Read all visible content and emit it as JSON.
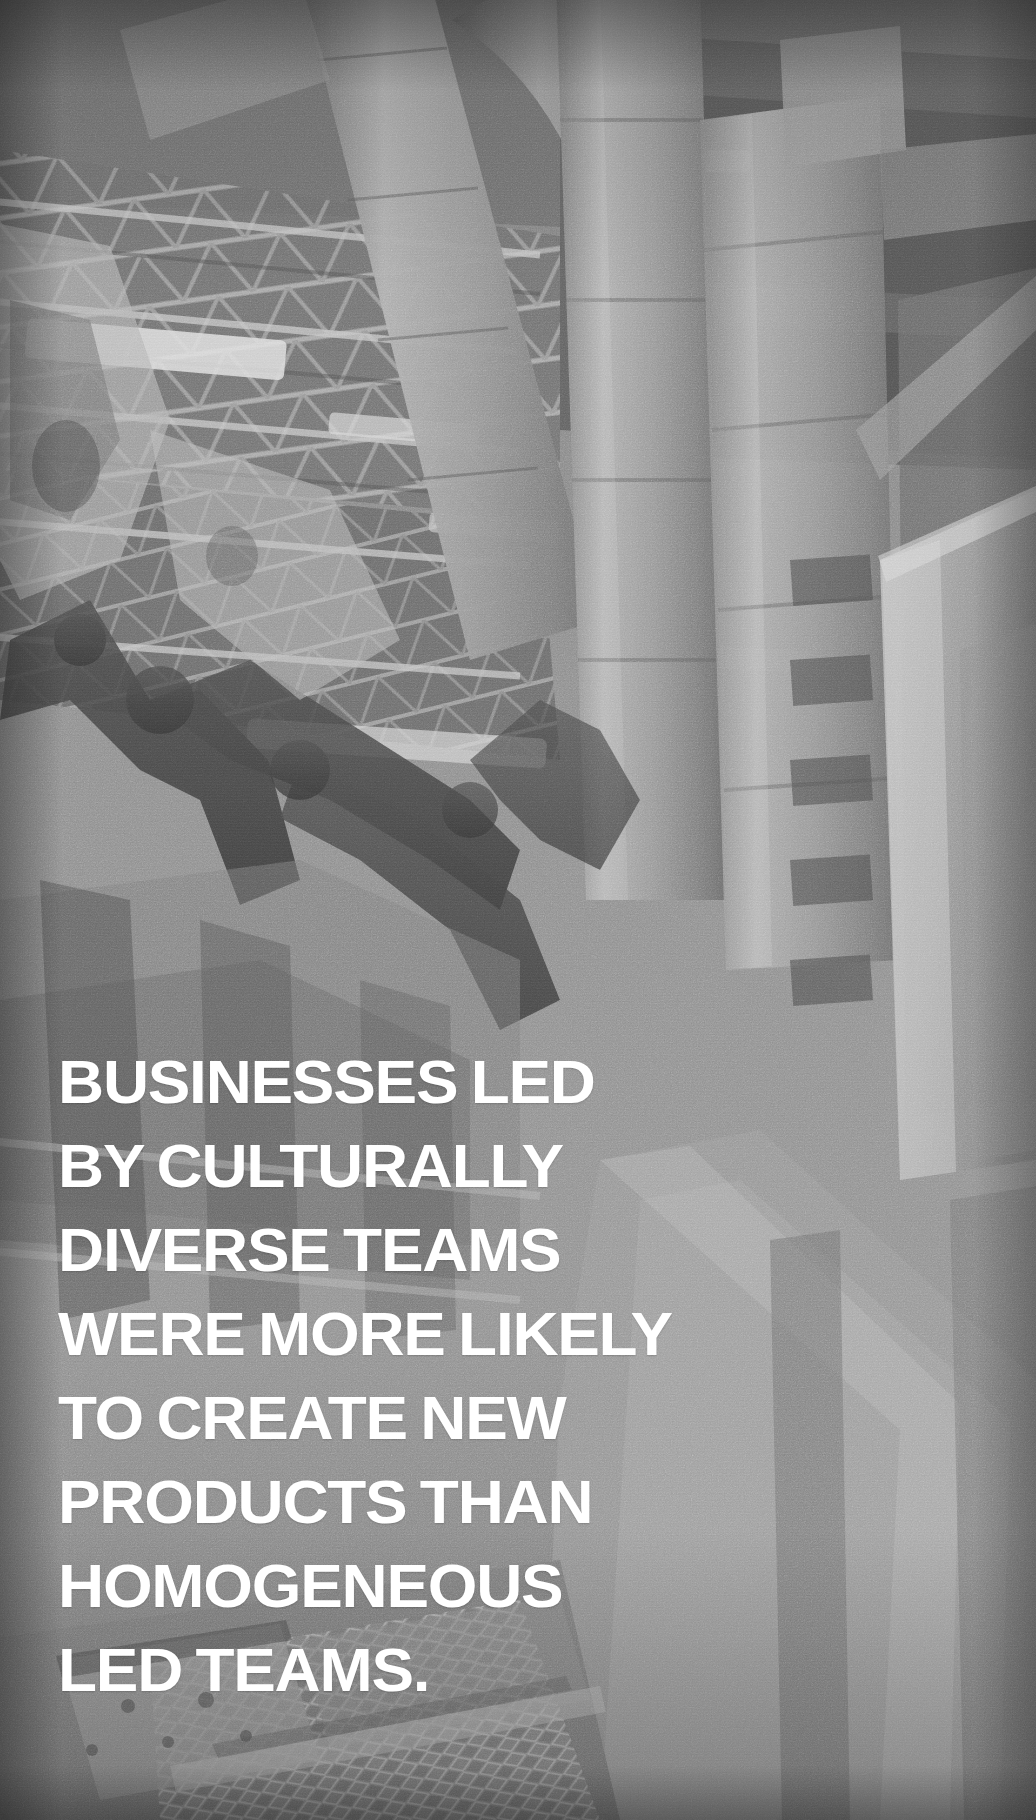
{
  "poster": {
    "width": 1036,
    "height": 1820,
    "media_type": "photographic-quote-card",
    "background_subject": "industrial factory interior with robotic assembly arms, overhead ductwork, steel roof trusses and metal grating floor",
    "background_treatment": "black-and-white, high-grain / film-noise, slight vignette"
  },
  "quote": {
    "lines": [
      "BUSINESSES LED",
      "BY CULTURALLY",
      "DIVERSE TEAMS",
      "WERE MORE LIKELY",
      "TO CREATE NEW",
      "PRODUCTS THAN",
      "HOMOGENEOUS",
      "LED TEAMS."
    ],
    "full_text": "BUSINESSES LED BY CULTURALLY DIVERSE TEAMS WERE MORE LIKELY TO CREATE NEW PRODUCTS THAN HOMOGENEOUS LED TEAMS.",
    "alignment": "left",
    "case": "uppercase"
  },
  "colors": {
    "text": "#ffffff",
    "background_midtone": "#8d8d8d",
    "background_shadow": "#3c3c3c",
    "background_highlight": "#d2d2d2",
    "vignette": "#1a1a1a"
  }
}
